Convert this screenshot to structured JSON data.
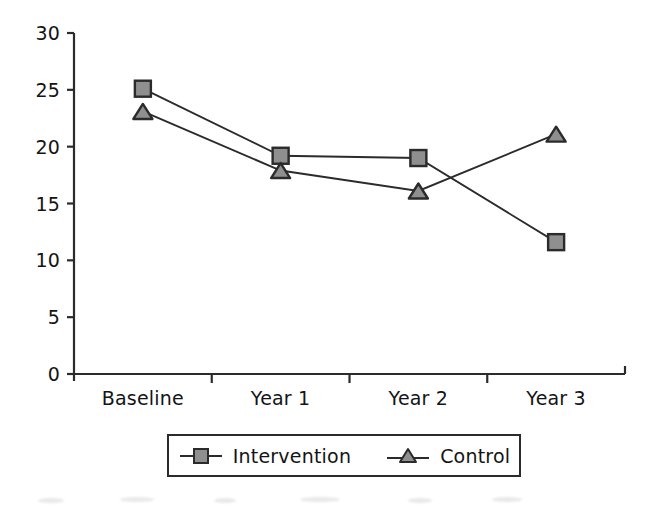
{
  "chart_data": {
    "type": "line",
    "title": "",
    "xlabel": "",
    "ylabel": "",
    "categories": [
      "Baseline",
      "Year 1",
      "Year 2",
      "Year 3"
    ],
    "series": [
      {
        "name": "Intervention",
        "marker": "square",
        "values": [
          25.1,
          19.2,
          19.0,
          11.6
        ]
      },
      {
        "name": "Control",
        "marker": "triangle",
        "values": [
          23.1,
          17.9,
          16.1,
          21.1
        ]
      }
    ],
    "ylim": [
      0,
      30
    ],
    "yticks": [
      0,
      5,
      10,
      15,
      20,
      25,
      30
    ],
    "ytick_labels": [
      "0",
      "5",
      "10",
      "15",
      "20",
      "25",
      "30"
    ],
    "grid": false,
    "legend_position": "bottom",
    "colors": {
      "line": "#2b2b2b",
      "marker_fill": "#8f8f8f",
      "marker_edge": "#2b2b2b",
      "axis": "#2b2b2b",
      "background": "#ffffff",
      "text": "#141414"
    }
  },
  "legend": {
    "entries": [
      {
        "label": "Intervention",
        "icon": "square-marker-icon"
      },
      {
        "label": "Control",
        "icon": "triangle-marker-icon"
      }
    ]
  },
  "axes": {
    "y_axis_name": "y-axis",
    "x_axis_name": "x-axis"
  }
}
